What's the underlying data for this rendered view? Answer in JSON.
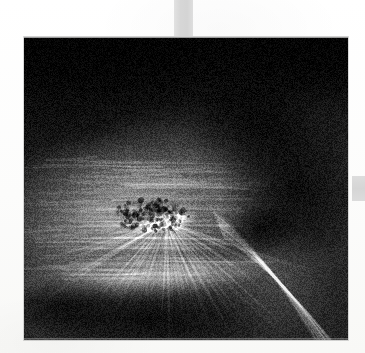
{
  "page": {
    "background_color": "#fdfdfc",
    "width": 365,
    "height": 353,
    "caption": ""
  },
  "margin_marks": [
    {
      "name": "top-register-block",
      "color": "#d9d9d9",
      "x": 174,
      "y": 0,
      "width": 19,
      "height": 38
    },
    {
      "name": "right-register-block",
      "color": "#d9d9d9",
      "x": 352,
      "y": 176,
      "width": 13,
      "height": 25
    }
  ],
  "plate": {
    "label": "",
    "x": 24,
    "y": 37,
    "width": 324,
    "height": 303,
    "palette": {
      "shadow": "#090909",
      "dark": "#1b1b1b",
      "midtone": "#6a6a6a",
      "light": "#b4b4b4",
      "highlight": "#f2f2f0"
    },
    "rendering": {
      "type": "grayscale-photographic-plate",
      "grain": true,
      "grain_strength": 0.16,
      "vignette": true
    },
    "features": [
      {
        "name": "bright-core",
        "description": "compact high-intensity nucleus",
        "cx": 0.44,
        "cy": 0.61,
        "rx": 0.1,
        "ry": 0.035,
        "angle_deg": -12,
        "intensity": 1.0
      },
      {
        "name": "radiating-fan",
        "description": "fan of fine streaks emanating upward and left from the core",
        "cx": 0.44,
        "cy": 0.61,
        "spread_deg": 150,
        "start_deg": 170,
        "length": 0.46,
        "ray_count": 46,
        "intensity": 0.62
      },
      {
        "name": "horizontal-striations",
        "description": "layered horizontal filaments across the left half",
        "cy": 0.58,
        "intensity": 0.5
      },
      {
        "name": "lower-bright-band",
        "description": "broad lighter band sweeping beneath the core",
        "cy": 0.8,
        "intensity": 0.55
      },
      {
        "name": "diagonal-jet",
        "description": "bright narrow streak trailing to the lower right corner",
        "x0": 0.6,
        "y0": 0.62,
        "x1": 0.94,
        "y1": 1.02,
        "intensity": 0.72
      },
      {
        "name": "right-dark-lobe",
        "description": "dense dark lobe occupying the right third",
        "cx": 0.8,
        "cy": 0.52,
        "intensity": 0.08
      },
      {
        "name": "upper-dark-field",
        "description": "near-black background filling the top of the plate",
        "cy": 0.12,
        "intensity": 0.07
      }
    ]
  }
}
